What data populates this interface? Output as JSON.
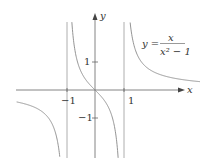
{
  "chart_data": {
    "type": "line",
    "title": "",
    "function_label": {
      "lhs": "y =",
      "numerator": "x",
      "denominator": "x² − 1"
    },
    "xlabel": "x",
    "ylabel": "y",
    "x_ticks": [
      {
        "value": -1,
        "label": "−1"
      },
      {
        "value": 1,
        "label": "1"
      }
    ],
    "y_ticks": [
      {
        "value": 1,
        "label": "1"
      },
      {
        "value": -1,
        "label": "−1"
      }
    ],
    "asymptotes": {
      "vertical": [
        -1,
        1
      ],
      "horizontal": [
        0
      ]
    },
    "xlim": [
      -3.3,
      4.6
    ],
    "ylim": [
      -3.0,
      3.2
    ],
    "grid": false,
    "legend": null,
    "series": [
      {
        "name": "y = x/(x^2 - 1)",
        "color": "#888888"
      }
    ]
  }
}
